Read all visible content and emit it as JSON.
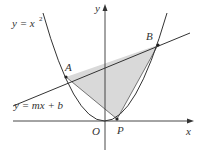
{
  "figure": {
    "curve_label": "y = x",
    "curve_label_exponent": "2",
    "line_label": "y = mx + b",
    "x_axis_label": "x",
    "y_axis_label": "y",
    "origin_label": "O",
    "points": [
      {
        "name": "A",
        "label": "A"
      },
      {
        "name": "B",
        "label": "B"
      },
      {
        "name": "P",
        "label": "P"
      }
    ],
    "colors": {
      "stroke": "#333333",
      "shade": "#d9d9d9",
      "background": "#ffffff"
    }
  }
}
